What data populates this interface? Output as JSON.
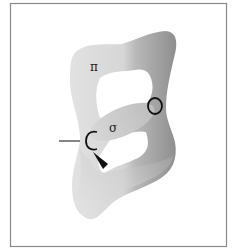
{
  "diagram": {
    "title": "",
    "labels": {
      "pi_bond": "π",
      "sigma_bond": "σ",
      "carbon": "C",
      "oxygen": "O"
    },
    "colors": {
      "frame": "#8a8a8a",
      "lobe_light": "#dcdcdc",
      "lobe_dark": "#9a9a9a",
      "sigma": "#cfcfcf",
      "ink": "#111111"
    }
  }
}
